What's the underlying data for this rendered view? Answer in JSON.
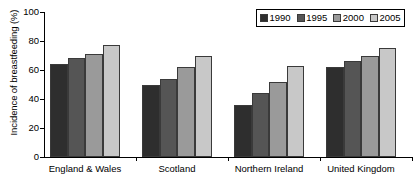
{
  "chart_data": {
    "type": "bar",
    "title": "",
    "xlabel": "",
    "ylabel": "Incidence of breastfeeding (%)",
    "ylim": [
      0,
      100
    ],
    "yticks": [
      "0",
      "20",
      "40",
      "60",
      "80",
      "100"
    ],
    "grid": false,
    "legend_position": "top-right",
    "categories": [
      "England & Wales",
      "Scotland",
      "Northern Ireland",
      "United Kingdom"
    ],
    "series": [
      {
        "name": "1990",
        "color": "#2e2e2e",
        "values": [
          64,
          50,
          36,
          62
        ]
      },
      {
        "name": "1995",
        "color": "#555555",
        "values": [
          68,
          54,
          44,
          66
        ]
      },
      {
        "name": "2000",
        "color": "#9a9a9a",
        "values": [
          71,
          62,
          52,
          70
        ]
      },
      {
        "name": "2005",
        "color": "#c8c8c8",
        "values": [
          77,
          70,
          63,
          75
        ]
      }
    ]
  }
}
